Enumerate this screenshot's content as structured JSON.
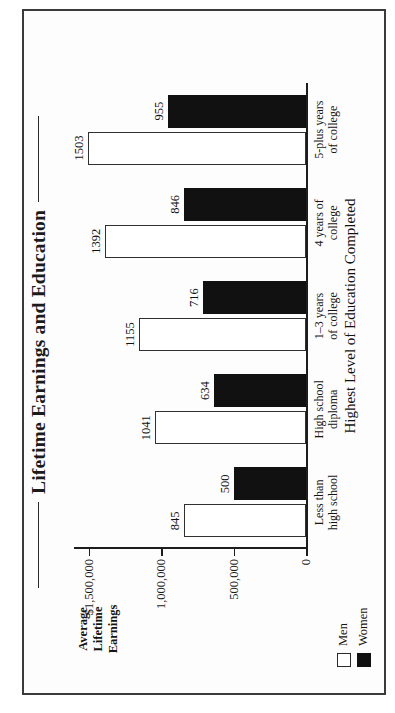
{
  "chart_data": {
    "type": "bar",
    "title": "Lifetime Earnings and Education",
    "xlabel": "Highest Level of Education Completed",
    "ylabel": "Average Lifetime Earnings",
    "orientation": "vertical-bars-rotated-90ccw-on-page",
    "grid": false,
    "legend_position": "bottom-left",
    "value_units": "thousands of dollars",
    "categories": [
      "Less than high school",
      "High school diploma",
      "1–3 years of college",
      "4 years of college",
      "5-plus years of college"
    ],
    "category_label_lines": [
      [
        "Less than",
        "high school"
      ],
      [
        "High school",
        "diploma"
      ],
      [
        "1–3 years",
        "of college"
      ],
      [
        "4 years of",
        "college"
      ],
      [
        "5-plus years",
        "of college"
      ]
    ],
    "series": [
      {
        "name": "Men",
        "color": "#ffffff",
        "values": [
          845,
          1041,
          1155,
          1392,
          1503
        ]
      },
      {
        "name": "Women",
        "color": "#111111",
        "values": [
          500,
          634,
          716,
          846,
          955
        ]
      }
    ],
    "ylim": [
      0,
      1600
    ],
    "yticks": [
      0,
      500,
      1000,
      1500
    ],
    "ytick_labels": [
      "0",
      "500,000",
      "1,000,000",
      "$1,500,000"
    ]
  },
  "title": {
    "text": "Lifetime Earnings and Education"
  },
  "axes": {
    "y_title_lines": [
      "Average",
      "Lifetime",
      "Earnings"
    ],
    "x_title": "Highest Level of Education Completed"
  },
  "legend": {
    "items": [
      {
        "label": "Men",
        "swatch": "white-square-outline"
      },
      {
        "label": "Women",
        "swatch": "black-square-filled"
      }
    ]
  }
}
